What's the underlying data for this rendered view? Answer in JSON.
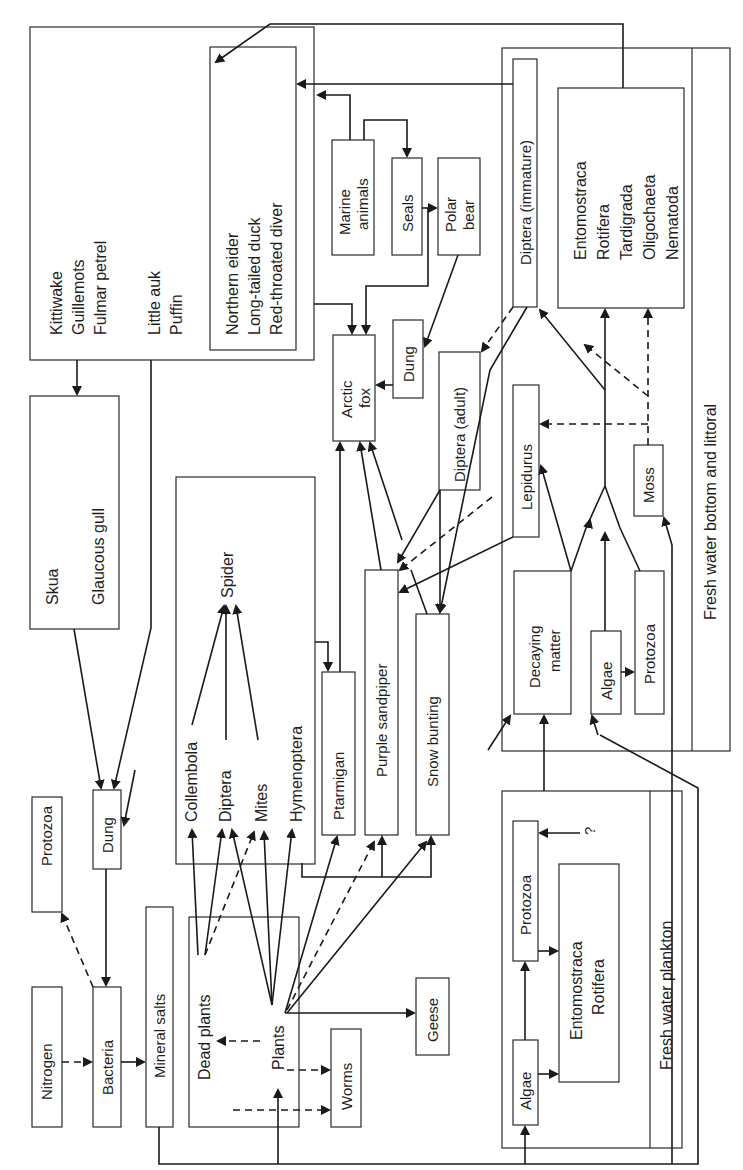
{
  "diagram": {
    "orientation": "rotated-counterclockwise",
    "nodes": {
      "seabirds_group": {
        "lines": [
          "Kittiwake",
          "Guillemots",
          "Fulmar petrel",
          "",
          "Little auk",
          "Puffin"
        ]
      },
      "ducks_group": {
        "lines": [
          "Northern eider",
          "Long-tailed duck",
          "Red-throated diver"
        ]
      },
      "marine_animals": {
        "lines": [
          "Marine",
          "animals"
        ]
      },
      "seals": {
        "lines": [
          "Seals"
        ]
      },
      "polar_bear": {
        "lines": [
          "Polar",
          "bear"
        ]
      },
      "arctic_fox": {
        "lines": [
          "Arctic",
          "fox"
        ]
      },
      "dung_fox": {
        "lines": [
          "Dung"
        ]
      },
      "skua_gull": {
        "lines": [
          "Skua",
          "",
          "Glaucous gull"
        ]
      },
      "spider_group": {
        "spider": "Spider",
        "prey": [
          "Collembola",
          "Diptera",
          "Mites",
          "Hymenoptera"
        ]
      },
      "ptarmigan": {
        "lines": [
          "Ptarmigan"
        ]
      },
      "purple_sandpiper": {
        "lines": [
          "Purple sandpiper"
        ]
      },
      "snow_bunting": {
        "lines": [
          "Snow bunting"
        ]
      },
      "diptera_adult": {
        "lines": [
          "Diptera (adult)"
        ]
      },
      "diptera_immature": {
        "lines": [
          "Diptera (immature)"
        ]
      },
      "benthos_group": {
        "lines": [
          "Entomostraca",
          "Rotifera",
          "Tardigrada",
          "Oligochaeta",
          "Nematoda"
        ]
      },
      "lepidurus": {
        "lines": [
          "Lepidurus"
        ]
      },
      "moss": {
        "lines": [
          "Moss"
        ]
      },
      "decaying_matter": {
        "lines": [
          "Decaying",
          "matter"
        ]
      },
      "algae_bottom": {
        "lines": [
          "Algae"
        ]
      },
      "protozoa_bottom": {
        "lines": [
          "Protozoa"
        ]
      },
      "fresh_water_bottom_label": "Fresh water bottom and littoral",
      "protozoa_soil": {
        "lines": [
          "Protozoa"
        ]
      },
      "dung_soil": {
        "lines": [
          "Dung"
        ]
      },
      "nitrogen": {
        "lines": [
          "Nitrogen"
        ]
      },
      "bacteria": {
        "lines": [
          "Bacteria"
        ]
      },
      "mineral_salts": {
        "lines": [
          "Mineral salts"
        ]
      },
      "plants_group": {
        "dead_plants": "Dead plants",
        "plants": "Plants"
      },
      "worms": {
        "lines": [
          "Worms"
        ]
      },
      "geese": {
        "lines": [
          "Geese"
        ]
      },
      "algae_plankton": {
        "lines": [
          "Algae"
        ]
      },
      "protozoa_plankton": {
        "lines": [
          "Protozoa"
        ]
      },
      "plankton_consumers": {
        "lines": [
          "Entomostraca",
          "Rotifera"
        ]
      },
      "fresh_water_plankton_label": "Fresh water plankton",
      "unknown_marker": "?"
    },
    "legend_hint": {
      "solid_arrow": "feeding relationship",
      "dashed_arrow": "minor / uncertain relationship"
    },
    "colors": {
      "stroke": "#1a1a1a",
      "background": "#ffffff"
    }
  }
}
